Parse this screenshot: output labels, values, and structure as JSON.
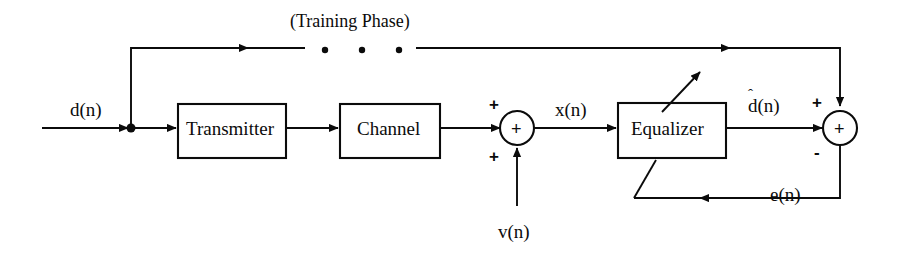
{
  "diagram": {
    "background_color": "#ffffff",
    "line_color": "#0b0b0b",
    "blocks": [
      {
        "id": "transmitter",
        "label": "Transmitter",
        "x": 178,
        "y": 104,
        "w": 108,
        "h": 54
      },
      {
        "id": "channel",
        "label": "Channel",
        "x": 340,
        "y": 104,
        "w": 100,
        "h": 54
      },
      {
        "id": "equalizer",
        "label": "Equalizer",
        "x": 618,
        "y": 103,
        "w": 108,
        "h": 55
      }
    ],
    "summing_junctions": [
      {
        "id": "channel-noise-adder",
        "inner_symbol": "+",
        "cx": 517,
        "cy": 128,
        "r": 17,
        "sign_top": "+",
        "sign_bottom": "+"
      },
      {
        "id": "error-adder",
        "inner_symbol": "+",
        "cx": 840,
        "cy": 128,
        "r": 17,
        "sign_top": "+",
        "sign_bottom": "-"
      }
    ],
    "signal_labels": [
      {
        "id": "input-signal",
        "text": "d(n)",
        "x": 70,
        "y": 100
      },
      {
        "id": "channel-output-signal",
        "text": "x(n)",
        "x": 555,
        "y": 100
      },
      {
        "id": "noise-signal",
        "text": "v(n)",
        "x": 498,
        "y": 222
      },
      {
        "id": "equalizer-output-signal",
        "base": "d",
        "hat": "ˆ",
        "suffix": "(n)",
        "x": 748,
        "y": 96
      },
      {
        "id": "error-signal",
        "text": "e(n)",
        "x": 770,
        "y": 185
      }
    ],
    "annotations": [
      {
        "id": "training-phase-note",
        "text": "(Training Phase)",
        "x": 290,
        "y": 12
      }
    ],
    "dots": [
      {
        "id": "training-gap-dot-1",
        "cx": 325,
        "cy": 50,
        "r": 3
      },
      {
        "id": "training-gap-dot-2",
        "cx": 362,
        "cy": 50,
        "r": 3
      },
      {
        "id": "training-gap-dot-3",
        "cx": 399,
        "cy": 50,
        "r": 3
      }
    ],
    "junction_node": {
      "id": "input-branch-node",
      "cx": 131,
      "cy": 128,
      "r": 4.5
    }
  }
}
